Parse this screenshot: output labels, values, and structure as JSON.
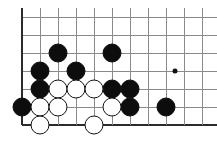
{
  "figure": {
    "kind": "go-board-diagram",
    "board": {
      "origin_x": 22,
      "origin_y": 17,
      "spacing": 18,
      "cols": 11,
      "rows": 7,
      "left_edge_col": 0,
      "bottom_edge_row": 6,
      "line_color": "#8a8a8a",
      "edge_color": "#2b2b2b",
      "background_color": "#ffffff"
    },
    "star_points": [
      {
        "col": 8.5,
        "row": 3,
        "label": "hoshi"
      }
    ],
    "stone_colors": {
      "black_fill": "#0d0d0d",
      "white_fill": "#ffffff",
      "white_outline": "#111111"
    },
    "stone_diameter": 19,
    "stones": [
      {
        "color": "black",
        "col": 2,
        "row": 2
      },
      {
        "color": "black",
        "col": 5,
        "row": 2
      },
      {
        "color": "black",
        "col": 1,
        "row": 3
      },
      {
        "color": "black",
        "col": 3,
        "row": 3
      },
      {
        "color": "black",
        "col": 1,
        "row": 4
      },
      {
        "color": "black",
        "col": 5,
        "row": 4
      },
      {
        "color": "black",
        "col": 6,
        "row": 4
      },
      {
        "color": "black",
        "col": 0,
        "row": 5
      },
      {
        "color": "black",
        "col": 6,
        "row": 5
      },
      {
        "color": "black",
        "col": 8,
        "row": 5
      },
      {
        "color": "white",
        "col": 2,
        "row": 4
      },
      {
        "color": "white",
        "col": 3,
        "row": 4
      },
      {
        "color": "white",
        "col": 4,
        "row": 4
      },
      {
        "color": "white",
        "col": 1,
        "row": 5
      },
      {
        "color": "white",
        "col": 2,
        "row": 5
      },
      {
        "color": "white",
        "col": 5,
        "row": 5
      },
      {
        "color": "white",
        "col": 1,
        "row": 6
      },
      {
        "color": "white",
        "col": 4,
        "row": 6
      }
    ]
  }
}
